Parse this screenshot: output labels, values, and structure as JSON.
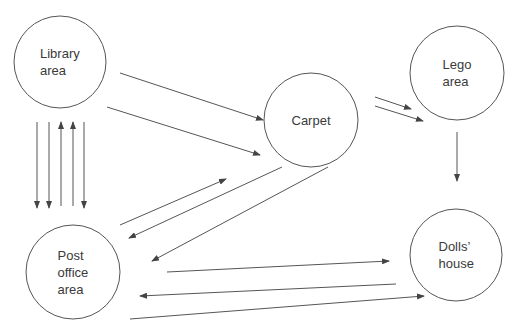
{
  "diagram": {
    "type": "flow-diagram",
    "stroke_color": "#555555",
    "text_color": "#3a3a3a",
    "background": "#ffffff",
    "nodes": [
      {
        "id": "library",
        "label_lines": [
          "Library",
          "area"
        ],
        "cx": 60,
        "cy": 62,
        "r": 46
      },
      {
        "id": "carpet",
        "label_lines": [
          "Carpet"
        ],
        "cx": 311,
        "cy": 120,
        "r": 47
      },
      {
        "id": "lego",
        "label_lines": [
          "Lego",
          "area"
        ],
        "cx": 457,
        "cy": 73,
        "r": 47
      },
      {
        "id": "post",
        "label_lines": [
          "Post",
          "office",
          "area"
        ],
        "cx": 73,
        "cy": 272,
        "r": 47
      },
      {
        "id": "dolls",
        "label_lines": [
          "Dolls’",
          "house"
        ],
        "cx": 456,
        "cy": 255,
        "r": 46
      }
    ],
    "edges": [
      {
        "from": "library",
        "to": "carpet",
        "x1": 120,
        "y1": 73,
        "x2": 263,
        "y2": 120,
        "arrow": "end"
      },
      {
        "from": "library",
        "to": "carpet",
        "x1": 107,
        "y1": 107,
        "x2": 260,
        "y2": 155,
        "arrow": "end"
      },
      {
        "from": "carpet",
        "to": "lego",
        "x1": 375,
        "y1": 97,
        "x2": 411,
        "y2": 109,
        "arrow": "end"
      },
      {
        "from": "carpet",
        "to": "lego",
        "x1": 375,
        "y1": 106,
        "x2": 423,
        "y2": 121,
        "arrow": "end"
      },
      {
        "from": "lego",
        "to": "dolls",
        "x1": 457,
        "y1": 132,
        "x2": 457,
        "y2": 181,
        "arrow": "end"
      },
      {
        "from": "library",
        "to": "post",
        "x1": 37,
        "y1": 122,
        "x2": 37,
        "y2": 208,
        "arrow": "end"
      },
      {
        "from": "library",
        "to": "post",
        "x1": 49,
        "y1": 122,
        "x2": 49,
        "y2": 208,
        "arrow": "end"
      },
      {
        "from": "post",
        "to": "library",
        "x1": 61,
        "y1": 206,
        "x2": 61,
        "y2": 122,
        "arrow": "end"
      },
      {
        "from": "post",
        "to": "library",
        "x1": 73,
        "y1": 206,
        "x2": 73,
        "y2": 122,
        "arrow": "end"
      },
      {
        "from": "library",
        "to": "post",
        "x1": 84,
        "y1": 122,
        "x2": 84,
        "y2": 208,
        "arrow": "end"
      },
      {
        "from": "post",
        "to": "carpet",
        "x1": 120,
        "y1": 225,
        "x2": 226,
        "y2": 179,
        "arrow": "end"
      },
      {
        "from": "carpet",
        "to": "post",
        "x1": 282,
        "y1": 167,
        "x2": 129,
        "y2": 238,
        "arrow": "end"
      },
      {
        "from": "carpet",
        "to": "post",
        "x1": 328,
        "y1": 167,
        "x2": 152,
        "y2": 261,
        "arrow": "end"
      },
      {
        "from": "post",
        "to": "dolls",
        "x1": 167,
        "y1": 272,
        "x2": 389,
        "y2": 261,
        "arrow": "end"
      },
      {
        "from": "dolls",
        "to": "post",
        "x1": 396,
        "y1": 284,
        "x2": 140,
        "y2": 296,
        "arrow": "end"
      },
      {
        "from": "post",
        "to": "dolls",
        "x1": 130,
        "y1": 319,
        "x2": 424,
        "y2": 296,
        "arrow": "end"
      }
    ]
  }
}
